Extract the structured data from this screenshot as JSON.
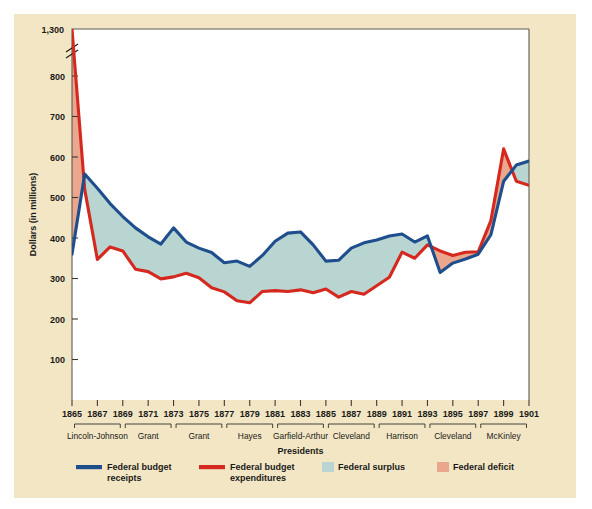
{
  "figure": {
    "background_color": "#ffffff",
    "panel_color": "#f3e6c4",
    "plot_color": "#ffffff"
  },
  "chart_data": {
    "type": "line",
    "title": "",
    "xlabel": "Presidents",
    "ylabel": "Dollars (in millions)",
    "grid": false,
    "legend_position": "bottom",
    "xlim": [
      1865,
      1901
    ],
    "ylim": [
      0,
      1300
    ],
    "y_axis_break": {
      "from": 800,
      "to": 1300,
      "note": "axis break between 800 and 1,300"
    },
    "ytick_labels": [
      "100",
      "200",
      "300",
      "400",
      "500",
      "600",
      "700",
      "800",
      "1,300"
    ],
    "yticks": [
      100,
      200,
      300,
      400,
      500,
      600,
      700,
      800,
      1300
    ],
    "xtick_labels": [
      "1865",
      "1867",
      "1869",
      "1871",
      "1873",
      "1875",
      "1877",
      "1879",
      "1881",
      "1883",
      "1885",
      "1887",
      "1889",
      "1891",
      "1893",
      "1895",
      "1897",
      "1899",
      "1901"
    ],
    "xticks": [
      1865,
      1867,
      1869,
      1871,
      1873,
      1875,
      1877,
      1879,
      1881,
      1883,
      1885,
      1887,
      1889,
      1891,
      1893,
      1895,
      1897,
      1899,
      1901
    ],
    "x": [
      1865,
      1866,
      1867,
      1868,
      1869,
      1870,
      1871,
      1872,
      1873,
      1874,
      1875,
      1876,
      1877,
      1878,
      1879,
      1880,
      1881,
      1882,
      1883,
      1884,
      1885,
      1886,
      1887,
      1888,
      1889,
      1890,
      1891,
      1892,
      1893,
      1894,
      1895,
      1896,
      1897,
      1898,
      1899,
      1900,
      1901
    ],
    "series": [
      {
        "name": "Federal budget receipts",
        "color": "#1f4e8c",
        "values": [
          360,
          558,
          523,
          485,
          453,
          425,
          403,
          385,
          425,
          390,
          375,
          364,
          339,
          343,
          330,
          357,
          392,
          412,
          415,
          383,
          343,
          345,
          375,
          388,
          395,
          405,
          410,
          390,
          405,
          315,
          338,
          348,
          360,
          408,
          540,
          580,
          590
        ]
      },
      {
        "name": "Federal budget expenditures",
        "color": "#d5291f",
        "values": [
          1298,
          520,
          347,
          378,
          368,
          323,
          317,
          299,
          304,
          313,
          302,
          277,
          267,
          245,
          240,
          268,
          270,
          268,
          272,
          265,
          274,
          254,
          268,
          261,
          282,
          303,
          365,
          350,
          383,
          368,
          357,
          365,
          366,
          443,
          620,
          540,
          530
        ]
      }
    ],
    "bands": [
      {
        "name": "Federal surplus",
        "color": "#b9d5d1",
        "description": "area where receipts exceed expenditures"
      },
      {
        "name": "Federal deficit",
        "color": "#eaa78d",
        "description": "area where expenditures exceed receipts"
      }
    ]
  },
  "presidents": [
    {
      "label": "Lincoln-Johnson",
      "start": 1865,
      "end": 1869
    },
    {
      "label": "Grant",
      "start": 1869,
      "end": 1873
    },
    {
      "label": "Grant",
      "start": 1873,
      "end": 1877
    },
    {
      "label": "Hayes",
      "start": 1877,
      "end": 1881
    },
    {
      "label": "Garfield-Arthur",
      "start": 1881,
      "end": 1885
    },
    {
      "label": "Cleveland",
      "start": 1885,
      "end": 1889
    },
    {
      "label": "Harrison",
      "start": 1889,
      "end": 1893
    },
    {
      "label": "Cleveland",
      "start": 1893,
      "end": 1897
    },
    {
      "label": "McKinley",
      "start": 1897,
      "end": 1901
    }
  ],
  "legend": [
    {
      "label": "Federal budget receipts",
      "line1": "Federal budget",
      "line2": "receipts",
      "color": "#1f4e8c",
      "swatch": "line"
    },
    {
      "label": "Federal budget expenditures",
      "line1": "Federal budget",
      "line2": "expenditures",
      "color": "#d5291f",
      "swatch": "line"
    },
    {
      "label": "Federal surplus",
      "line1": "Federal surplus",
      "line2": "",
      "color": "#b9d5d1",
      "swatch": "box"
    },
    {
      "label": "Federal deficit",
      "line1": "Federal deficit",
      "line2": "",
      "color": "#eaa78d",
      "swatch": "box"
    }
  ]
}
